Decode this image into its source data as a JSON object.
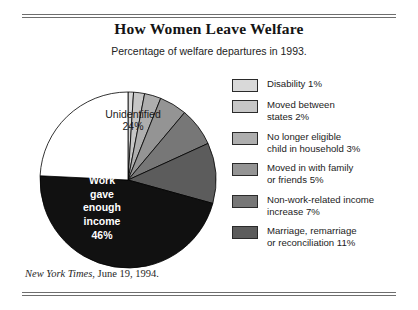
{
  "figure": {
    "title": "How Women Leave Welfare",
    "subtitle": "Percentage of welfare departures in 1993.",
    "source_publication": "New York Times",
    "source_rest": ", June 19, 1994."
  },
  "pie_labels": {
    "unidentified": "Unidentified\n24%",
    "work": "Work\ngave\nenough\nincome\n46%"
  },
  "legend": {
    "items": [
      {
        "label": "Disability 1%",
        "color": "#d9d9d9"
      },
      {
        "label": "Moved between\nstates 2%",
        "color": "#c6c6c6"
      },
      {
        "label": "No longer eligible\nchild in household 3%",
        "color": "#aeaeae"
      },
      {
        "label": "Moved in with family\nor friends 5%",
        "color": "#949494"
      },
      {
        "label": "Non-work-related income\nincrease 7%",
        "color": "#777777"
      },
      {
        "label": "Marriage, remarriage\nor reconciliation 11%",
        "color": "#5c5c5c"
      }
    ]
  },
  "chart_data": {
    "type": "pie",
    "title": "How Women Leave Welfare",
    "subtitle": "Percentage of welfare departures in 1993.",
    "units": "percent",
    "total": 99,
    "start_angle_deg": 0,
    "direction": "clockwise",
    "legend_position": "right",
    "source": "New York Times, June 19, 1994.",
    "labels": [
      "Disability",
      "Moved between states",
      "No longer eligible child in household",
      "Moved in with family or friends",
      "Non-work-related income increase",
      "Marriage, remarriage or reconciliation",
      "Work gave enough income",
      "Unidentified"
    ],
    "values": [
      1,
      2,
      3,
      5,
      7,
      11,
      46,
      24
    ],
    "colors": [
      "#d9d9d9",
      "#c6c6c6",
      "#aeaeae",
      "#949494",
      "#777777",
      "#5c5c5c",
      "#111111",
      "#ffffff"
    ],
    "labeled_on_chart": [
      {
        "label": "Unidentified",
        "value": 24,
        "text": "Unidentified 24%"
      },
      {
        "label": "Work gave enough income",
        "value": 46,
        "text": "Work gave enough income 46%"
      }
    ]
  }
}
